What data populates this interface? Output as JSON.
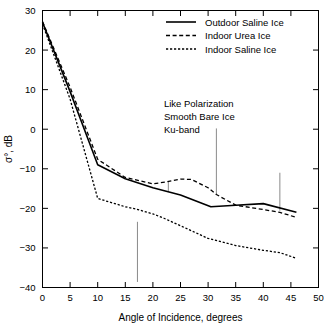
{
  "chart_data": {
    "type": "line",
    "title": "",
    "xlabel": "Angle of Incidence, degrees",
    "ylabel": "σ°, dB",
    "xlim": [
      0,
      50
    ],
    "ylim": [
      -40,
      30
    ],
    "xticks": [
      0,
      5,
      10,
      15,
      20,
      25,
      30,
      35,
      40,
      45,
      50
    ],
    "xtick_labels": [
      "0",
      "5",
      "10",
      "15",
      "20",
      "25",
      "30",
      "35",
      "40",
      "45",
      "50"
    ],
    "yticks": [
      -40,
      -30,
      -20,
      -10,
      0,
      10,
      20,
      30
    ],
    "ytick_labels": [
      "−40",
      "−30",
      "−20",
      "−10",
      "0",
      "10",
      "20",
      "30"
    ],
    "grid": false,
    "legend_position": "top-right",
    "series": [
      {
        "name": "Outdoor Saline Ice",
        "style": "solid",
        "dasharray": "",
        "width": 1.6,
        "x": [
          0,
          5,
          10,
          15,
          20,
          25,
          30.5,
          35,
          40,
          46
        ],
        "y": [
          27.0,
          9.5,
          -9.0,
          -12.5,
          -14.8,
          -16.6,
          -19.6,
          -19.2,
          -18.8,
          -21.0
        ]
      },
      {
        "name": "Indoor Urea Ice",
        "style": "dashed",
        "dasharray": "4,2.6",
        "width": 1.3,
        "x": [
          0,
          5,
          10,
          15,
          20,
          22.5,
          25,
          27,
          30,
          31.5,
          35,
          40,
          43,
          46
        ],
        "y": [
          27.2,
          10.6,
          -7.6,
          -12.2,
          -13.8,
          -13.3,
          -12.6,
          -12.7,
          -14.8,
          -16.5,
          -19.2,
          -20.3,
          -21.0,
          -22.3
        ]
      },
      {
        "name": "Indoor Saline Ice",
        "style": "dotted",
        "dasharray": "2.2,1.8",
        "width": 1.3,
        "x": [
          0,
          5,
          10,
          15,
          17,
          20,
          22,
          25,
          30,
          35,
          40,
          43,
          46
        ],
        "y": [
          26.6,
          7.6,
          -17.5,
          -19.6,
          -20.2,
          -21.4,
          -22.5,
          -24.4,
          -27.6,
          -29.4,
          -30.6,
          -31.2,
          -32.6
        ]
      }
    ],
    "annotations": [
      {
        "text": "Like Polarization",
        "x": 22.0,
        "y": 5.6
      },
      {
        "text": "Smooth Bare Ice",
        "x": 22.0,
        "y": 2.3
      },
      {
        "text": "Ku-band",
        "x": 22.0,
        "y": -1.0
      }
    ],
    "leader_lines": [
      {
        "x": 31.5,
        "y_top": 0.2,
        "y_bottom": -16.6
      },
      {
        "x": 22.8,
        "y_top": -13.2,
        "y_bottom": -15.6
      },
      {
        "x": 43.0,
        "y_top": -11.0,
        "y_bottom": -20.6
      },
      {
        "x": 17.2,
        "y_top": -23.4,
        "y_bottom": -38.6
      }
    ],
    "legend_entries": [
      {
        "label": "Outdoor Saline Ice",
        "style": "solid",
        "dasharray": "",
        "width": 1.6
      },
      {
        "label": "Indoor Urea Ice",
        "style": "dashed",
        "dasharray": "4,2.6",
        "width": 1.3
      },
      {
        "label": "Indoor Saline Ice",
        "style": "dotted",
        "dasharray": "2.2,1.8",
        "width": 1.3
      }
    ]
  }
}
